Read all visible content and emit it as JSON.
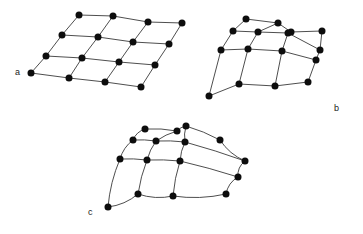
{
  "figure": {
    "background_color": "#ffffff",
    "node_color": "#0d0d0d",
    "edge_color": "#3a3a3a",
    "label_color": "#1a1a1a",
    "node_radius": 3.5,
    "edge_width": 0.9,
    "grid_rows": 4,
    "grid_cols": 4,
    "width": 363,
    "height": 234
  },
  "panels": [
    {
      "id": "a",
      "label": "a",
      "label_x": 15,
      "label_y": 75,
      "edge_style": "straight",
      "description": "regular sheared parallelogram lattice",
      "nodes": [
        [
          [
            79,
            15
          ],
          [
            113,
            16
          ],
          [
            148,
            22
          ],
          [
            182,
            23
          ]
        ],
        [
          [
            62,
            35
          ],
          [
            98,
            37
          ],
          [
            133,
            42
          ],
          [
            169,
            44
          ]
        ],
        [
          [
            46,
            56
          ],
          [
            82,
            58
          ],
          [
            119,
            62
          ],
          [
            155,
            65
          ]
        ],
        [
          [
            31,
            73
          ],
          [
            69,
            78
          ],
          [
            105,
            82
          ],
          [
            141,
            87
          ]
        ]
      ]
    },
    {
      "id": "b",
      "label": "b",
      "label_x": 334,
      "label_y": 111,
      "edge_style": "straight",
      "description": "irregularly deformed lattice with straight edges",
      "nodes": [
        [
          [
            246,
            19
          ],
          [
            278,
            23
          ],
          [
            291,
            32
          ],
          [
            322,
            31
          ]
        ],
        [
          [
            233,
            31
          ],
          [
            258,
            32
          ],
          [
            288,
            33
          ],
          [
            320,
            50
          ]
        ],
        [
          [
            221,
            50
          ],
          [
            248,
            49
          ],
          [
            282,
            51
          ],
          [
            316,
            60
          ]
        ],
        [
          [
            209,
            96
          ],
          [
            239,
            84
          ],
          [
            275,
            86
          ],
          [
            308,
            82
          ]
        ]
      ]
    },
    {
      "id": "c",
      "label": "c",
      "label_x": 88,
      "label_y": 215,
      "edge_style": "curved",
      "description": "smoothly warped lattice with curved edges",
      "nodes": [
        [
          [
            145,
            129
          ],
          [
            177,
            131
          ],
          [
            186,
            126
          ],
          [
            220,
            140
          ]
        ],
        [
          [
            133,
            140
          ],
          [
            156,
            141
          ],
          [
            185,
            142
          ],
          [
            245,
            161
          ]
        ],
        [
          [
            120,
            159
          ],
          [
            147,
            160
          ],
          [
            180,
            161
          ],
          [
            238,
            177
          ]
        ],
        [
          [
            108,
            207
          ],
          [
            138,
            194
          ],
          [
            173,
            196
          ],
          [
            226,
            194
          ]
        ]
      ]
    }
  ]
}
